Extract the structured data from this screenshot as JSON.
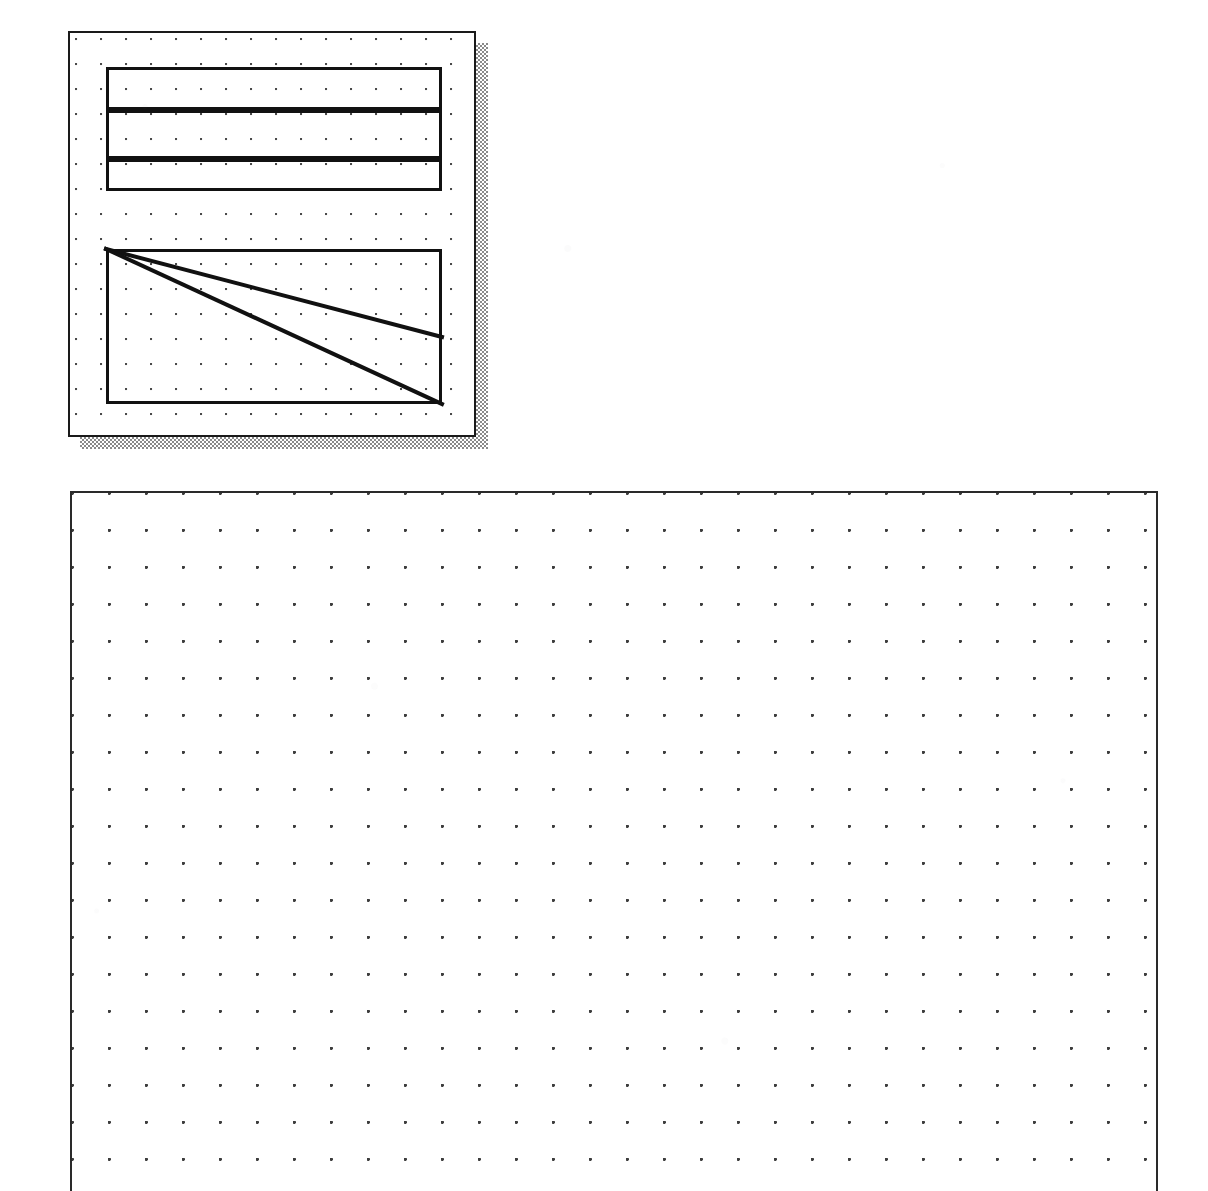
{
  "document": {
    "title": "Dot-grid drawing canvas",
    "medium": "scanned bitmap line drawing",
    "background_color": "#ffffff",
    "ink_color": "#111111",
    "grid_dot_color": "#3d3d3d",
    "shadow_color": "#8a8a8a"
  },
  "upper_panel": {
    "name": "Floating drawing window",
    "has_drop_shadow": true,
    "shadow_offset_px": 12,
    "border_color": "#1a1a1a",
    "border_width_px": 2,
    "grid_pitch_px": 25,
    "bounds": {
      "x": 68,
      "y": 31,
      "width": 408,
      "height": 406
    },
    "shapes": [
      {
        "id": "band-rect-top",
        "type": "rectangle",
        "label": "Top band",
        "x": 106,
        "y": 67,
        "width": 336,
        "height": 43,
        "stroke_px": 3
      },
      {
        "id": "band-rect-middle",
        "type": "rectangle",
        "label": "Middle band",
        "x": 106,
        "y": 110,
        "width": 336,
        "height": 49,
        "stroke_px": 3
      },
      {
        "id": "band-rect-bottom",
        "type": "rectangle",
        "label": "Bottom band",
        "x": 106,
        "y": 159,
        "width": 336,
        "height": 32,
        "stroke_px": 3
      },
      {
        "id": "diagonal-box-rect",
        "type": "rectangle",
        "label": "Diagonal box",
        "x": 106,
        "y": 249,
        "width": 336,
        "height": 155,
        "stroke_px": 3
      }
    ],
    "diagonals": [
      {
        "id": "diagonal-upper",
        "label": "Shallow diagonal",
        "from": [
          0,
          0
        ],
        "to": [
          336,
          88
        ],
        "stroke_px": 4
      },
      {
        "id": "diagonal-lower",
        "label": "Corner diagonal",
        "from": [
          0,
          0
        ],
        "to": [
          336,
          155
        ],
        "stroke_px": 4
      }
    ]
  },
  "main_canvas": {
    "name": "Main dot-grid canvas",
    "border_color": "#2a2a2a",
    "border_width_px": 2,
    "grid_pitch_px": 37,
    "bounds": {
      "x": 70,
      "y": 491,
      "width": 1088,
      "height": 700
    },
    "clipped_at_bottom": true,
    "content": "empty"
  }
}
